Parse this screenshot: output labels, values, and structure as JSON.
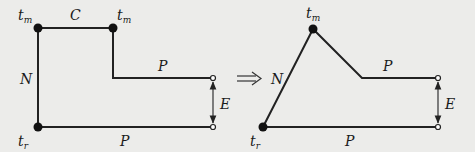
{
  "diagram": {
    "left": {
      "labels": {
        "tm_left": {
          "base": "t",
          "sub": "m"
        },
        "tm_right": {
          "base": "t",
          "sub": "m"
        },
        "C": "C",
        "N": "N",
        "P_top": "P",
        "E": "E",
        "tr": {
          "base": "t",
          "sub": "r"
        },
        "P_bottom": "P"
      }
    },
    "implies": "⟹",
    "right": {
      "labels": {
        "tm": {
          "base": "t",
          "sub": "m"
        },
        "N": "N",
        "P_top": "P",
        "E": "E",
        "tr": {
          "base": "t",
          "sub": "r"
        },
        "P_bottom": "P"
      }
    },
    "colors": {
      "background": "#ececea",
      "stroke": "#222222",
      "node_fill": "#111111",
      "open_node_fill": "#ffffff"
    }
  }
}
